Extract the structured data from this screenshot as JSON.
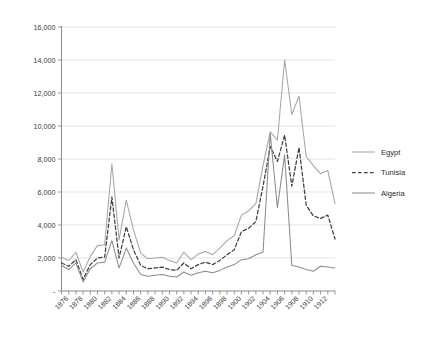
{
  "chart_data": {
    "type": "line",
    "title": "",
    "subtitle": "",
    "xlabel": "",
    "ylabel": "",
    "grid": "horizontal",
    "legend_position": "right",
    "xlim": [
      1875,
      1914
    ],
    "ylim": [
      0,
      16000
    ],
    "y_ticks": [
      "",
      "2,000",
      "4,000",
      "6,000",
      "8,000",
      "10,000",
      "12,000",
      "14,000",
      "16,000"
    ],
    "y_tick_values": [
      0,
      2000,
      4000,
      6000,
      8000,
      10000,
      12000,
      14000,
      16000
    ],
    "x_tick_labels": [
      "1876",
      "1878",
      "1880",
      "1882",
      "1884",
      "1886",
      "1888",
      "1890",
      "1892",
      "1894",
      "1896",
      "1898",
      "1900",
      "1902",
      "1904",
      "1906",
      "1908",
      "1910",
      "1912"
    ],
    "x": [
      1875,
      1876,
      1877,
      1878,
      1879,
      1880,
      1881,
      1882,
      1883,
      1884,
      1885,
      1886,
      1887,
      1888,
      1889,
      1890,
      1891,
      1892,
      1893,
      1894,
      1895,
      1896,
      1897,
      1898,
      1899,
      1900,
      1901,
      1902,
      1903,
      1904,
      1905,
      1906,
      1907,
      1908,
      1909,
      1910,
      1911,
      1912,
      1913
    ],
    "series": [
      {
        "name": "Egypt",
        "color": "#a6a6a6",
        "style": "solid",
        "values": [
          2050,
          1850,
          2350,
          1150,
          2100,
          2750,
          2800,
          7700,
          3100,
          5500,
          3700,
          2300,
          1950,
          2000,
          2050,
          1850,
          1700,
          2350,
          1900,
          2250,
          2400,
          2200,
          2600,
          3050,
          3350,
          4600,
          4850,
          5300,
          7600,
          9650,
          9150,
          14000,
          10700,
          11800,
          8150,
          7600,
          7100,
          7300,
          5300
        ]
      },
      {
        "name": "Tunisia",
        "color": "#404040",
        "style": "dashed",
        "values": [
          1700,
          1500,
          1900,
          700,
          1600,
          2000,
          2050,
          5700,
          2000,
          3900,
          2500,
          1550,
          1350,
          1400,
          1450,
          1300,
          1250,
          1700,
          1350,
          1600,
          1750,
          1600,
          1850,
          2200,
          2500,
          3600,
          3800,
          4200,
          6350,
          8750,
          7850,
          9450,
          6350,
          8700,
          5200,
          4550,
          4400,
          4600,
          3150
        ]
      },
      {
        "name": "Algeria",
        "color": "#8c8c8c",
        "style": "solid",
        "values": [
          1550,
          1300,
          1700,
          550,
          1350,
          1700,
          1750,
          3050,
          1400,
          2600,
          1700,
          1000,
          900,
          950,
          1000,
          900,
          850,
          1150,
          950,
          1100,
          1200,
          1100,
          1250,
          1450,
          1600,
          1900,
          1950,
          2200,
          2350,
          9550,
          5050,
          8250,
          1550,
          1450,
          1300,
          1200,
          1500,
          1450,
          1400
        ]
      }
    ]
  },
  "legend": {
    "items": [
      {
        "label": "Egypt"
      },
      {
        "label": "Tunisia"
      },
      {
        "label": "Algeria"
      }
    ]
  }
}
